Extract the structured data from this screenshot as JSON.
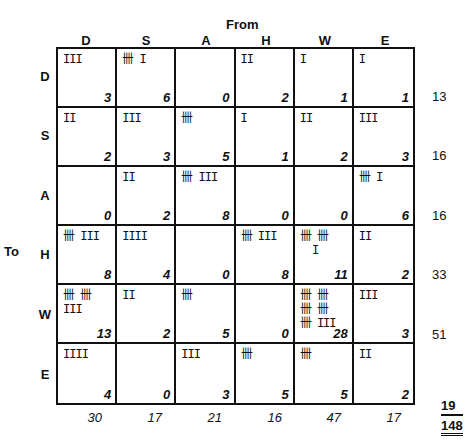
{
  "axis": {
    "from_label": "From",
    "to_label": "To"
  },
  "columns": [
    "D",
    "S",
    "A",
    "H",
    "W",
    "E"
  ],
  "rows": [
    {
      "label": "D",
      "cells": [
        {
          "tally": "III",
          "count": "3"
        },
        {
          "tally": "卌 I",
          "count": "6"
        },
        {
          "tally": "",
          "count": "0"
        },
        {
          "tally": "II",
          "count": "2"
        },
        {
          "tally": "I",
          "count": "1"
        },
        {
          "tally": "I",
          "count": "1"
        }
      ],
      "total": "13"
    },
    {
      "label": "S",
      "cells": [
        {
          "tally": "II",
          "count": "2"
        },
        {
          "tally": "III",
          "count": "3"
        },
        {
          "tally": "卌",
          "count": "5"
        },
        {
          "tally": "I",
          "count": "1"
        },
        {
          "tally": "II",
          "count": "2"
        },
        {
          "tally": "III",
          "count": "3"
        }
      ],
      "total": "16"
    },
    {
      "label": "A",
      "cells": [
        {
          "tally": "",
          "count": "0"
        },
        {
          "tally": "II",
          "count": "2"
        },
        {
          "tally": "卌 III",
          "count": "8"
        },
        {
          "tally": "",
          "count": "0"
        },
        {
          "tally": "",
          "count": "0"
        },
        {
          "tally": "卌 I",
          "count": "6"
        }
      ],
      "total": "16"
    },
    {
      "label": "H",
      "cells": [
        {
          "tally": "卌 III",
          "count": "8"
        },
        {
          "tally": "IIII",
          "count": "4"
        },
        {
          "tally": "",
          "count": "0"
        },
        {
          "tally": "卌 III",
          "count": "8"
        },
        {
          "tally": "卌 卌\n  I",
          "count": "11"
        },
        {
          "tally": "II",
          "count": "2"
        }
      ],
      "total": "33"
    },
    {
      "label": "W",
      "cells": [
        {
          "tally": "卌 卌\nIII",
          "count": "13"
        },
        {
          "tally": "II",
          "count": "2"
        },
        {
          "tally": "卌",
          "count": "5"
        },
        {
          "tally": "",
          "count": "0"
        },
        {
          "tally": "卌 卌\n卌 卌\n卌 III",
          "count": "28"
        },
        {
          "tally": "III",
          "count": "3"
        }
      ],
      "total": "51"
    },
    {
      "label": "E",
      "cells": [
        {
          "tally": "IIII",
          "count": "4"
        },
        {
          "tally": "",
          "count": "0"
        },
        {
          "tally": "III",
          "count": "3"
        },
        {
          "tally": "卌",
          "count": "5"
        },
        {
          "tally": "卌",
          "count": "5"
        },
        {
          "tally": "II",
          "count": "2"
        }
      ],
      "total": "19"
    }
  ],
  "column_totals": [
    "30",
    "17",
    "21",
    "16",
    "47",
    "17"
  ],
  "grand_total": "148"
}
